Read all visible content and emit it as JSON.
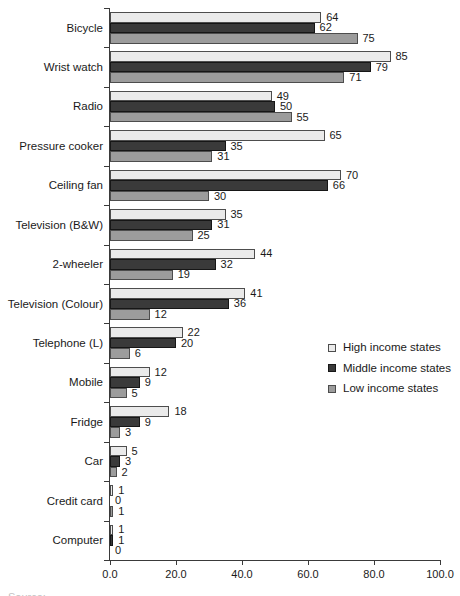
{
  "figure": {
    "caption_partial": "Source:"
  },
  "chart_data": {
    "type": "bar",
    "orientation": "horizontal",
    "title": "",
    "xlabel": "",
    "ylabel": "",
    "xlim": [
      0,
      100
    ],
    "grid": false,
    "legend_position": "middle-right",
    "value_labels_shown": true,
    "x_tick_labels": [
      "0.0",
      "20.0",
      "40.0",
      "60.0",
      "80.0",
      "100.0"
    ],
    "x_tick_values": [
      0,
      20,
      40,
      60,
      80,
      100
    ],
    "categories": [
      "Bicycle",
      "Wrist watch",
      "Radio",
      "Pressure cooker",
      "Ceiling fan",
      "Television (B&W)",
      "2-wheeler",
      "Television (Colour)",
      "Telephone (L)",
      "Mobile",
      "Fridge",
      "Car",
      "Credit card",
      "Computer"
    ],
    "series": [
      {
        "name": "High income states",
        "fill": "#eaeaea",
        "border": "#4d4d4d",
        "values": [
          64,
          85,
          49,
          65,
          70,
          35,
          44,
          41,
          22,
          12,
          18,
          5,
          1,
          1
        ]
      },
      {
        "name": "Middle income states",
        "fill": "#3a3a3a",
        "border": "#161616",
        "values": [
          62,
          79,
          50,
          35,
          66,
          31,
          32,
          36,
          20,
          9,
          9,
          3,
          0,
          1
        ]
      },
      {
        "name": "Low income states",
        "fill": "#9c9c9c",
        "border": "#4d4d4d",
        "values": [
          75,
          71,
          55,
          31,
          30,
          25,
          19,
          12,
          6,
          5,
          3,
          2,
          1,
          0
        ]
      }
    ]
  },
  "colors": {
    "text": "#1a1a1a",
    "axis": "#3a3a3a"
  }
}
